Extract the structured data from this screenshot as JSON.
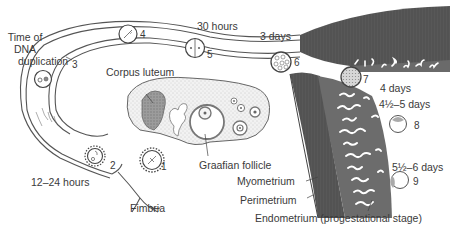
{
  "diagram": {
    "labels": {
      "time_of_dna_line1": "Time of",
      "time_of_dna_line2": "DNA",
      "time_of_dna_line3": "duplication",
      "hours_12_24": "12–24 hours",
      "hours_30": "30 hours",
      "days_3": "3 days",
      "days_4": "4 days",
      "days_4_5": "4½–5 days",
      "days_5_6": "5½–6 days",
      "corpus_luteum": "Corpus luteum",
      "graafian_follicle": "Graafian follicle",
      "fimbria": "Fimbria",
      "myometrium": "Myometrium",
      "perimetrium": "Perimetrium",
      "endometrium": "Endometrium (progestational stage)"
    },
    "stages": [
      {
        "number": "1",
        "description": "ovulated oocyte near fimbria"
      },
      {
        "number": "2",
        "description": "fertilization in ampulla"
      },
      {
        "number": "3",
        "description": "pronuclei stage"
      },
      {
        "number": "4",
        "description": "first cleavage spindle"
      },
      {
        "number": "5",
        "description": "2-cell stage"
      },
      {
        "number": "6",
        "description": "morula"
      },
      {
        "number": "7",
        "description": "late morula in uterus"
      },
      {
        "number": "8",
        "description": "blastocyst"
      },
      {
        "number": "9",
        "description": "implanting blastocyst"
      }
    ],
    "colors": {
      "line": "#555555",
      "muscle": "#5a5a5a",
      "endometrium": "#6e6e6e",
      "ovary_fill": "#eeeeee",
      "text": "#3a3a3a"
    }
  }
}
